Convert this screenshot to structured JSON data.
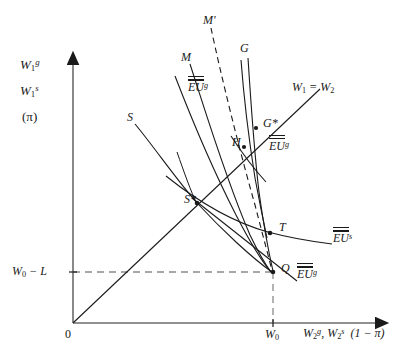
{
  "figure": {
    "type": "economics-indifference-diagram",
    "background": "#ffffff",
    "ink": "#1a1a1a",
    "width": 399,
    "height": 364
  },
  "axes": {
    "origin_label": "0",
    "y_axis_labels": [
      {
        "name": "y-label-wg",
        "text_html": "W<sub>1</sub><sup>g</sup>"
      },
      {
        "name": "y-label-ws",
        "text_html": "W<sub>1</sub><sup>s</sup>"
      },
      {
        "name": "y-label-pi",
        "text_html": "(π)"
      }
    ],
    "x_axis_label_html": "W<sub>2</sub><sup>g</sup>, W<sub>2</sub><sup>s</sup> &nbsp;(1 − π)",
    "x_tick_label_html": "W<sub>0</sub>",
    "y_tick_label_html": "W<sub>0</sub> − L",
    "x_tick_value": "W0",
    "y_tick_value": "W0-L"
  },
  "curve_labels": [
    {
      "name": "curve-label-M-prime",
      "text": "M'",
      "x": 203,
      "y": 14
    },
    {
      "name": "curve-label-M",
      "text": "M",
      "x": 183,
      "y": 51
    },
    {
      "name": "curve-label-G",
      "text": "G",
      "x": 241,
      "y": 42
    },
    {
      "name": "curve-label-S",
      "text": "S",
      "x": 128,
      "y": 112
    },
    {
      "name": "curve-label-W1-eq-W2",
      "text_html": "W<sub>1</sub> = W<sub>2</sub>",
      "x": 292,
      "y": 82
    },
    {
      "name": "curve-label-EUg-bar-upper",
      "text_html": "EU",
      "sup": "g",
      "bars": 1,
      "x": 191,
      "y": 82
    },
    {
      "name": "curve-label-EUg-doublebar",
      "text_html": "EU",
      "sup": "g",
      "bars": 2,
      "x": 271,
      "y": 141
    },
    {
      "name": "curve-label-EUs-bar",
      "text_html": "EU",
      "sup": "s",
      "bars": 1,
      "x": 334,
      "y": 232
    },
    {
      "name": "curve-label-EUg-bar-lower",
      "text_html": "EU",
      "sup": "g",
      "bars": 1,
      "x": 299,
      "y": 268
    }
  ],
  "points": [
    {
      "name": "point-G-star",
      "label": "G*",
      "x": 256,
      "y": 128,
      "label_dx": 7,
      "label_dy": -12
    },
    {
      "name": "point-H",
      "label": "H",
      "x": 243,
      "y": 147,
      "label_dx": -12,
      "label_dy": -12
    },
    {
      "name": "point-S-star",
      "label": "S*",
      "x": 196,
      "y": 203,
      "label_dx": -13,
      "label_dy": -11
    },
    {
      "name": "point-T",
      "label": "T",
      "x": 271,
      "y": 233,
      "label_dx": 8,
      "label_dy": -13
    },
    {
      "name": "point-Q",
      "label": "Q",
      "x": 273,
      "y": 272,
      "label_dx": 7,
      "label_dy": -11
    }
  ],
  "chart_data": {
    "type": "line",
    "title": "",
    "xlabel": "W2g, W2s (1 - pi)",
    "ylabel": "W1g, W1s (pi)",
    "axis_origin_px": [
      73,
      323
    ],
    "x_axis_end_px": [
      385,
      323
    ],
    "y_axis_top_px": [
      73,
      57
    ],
    "w0_px": 273,
    "w0_minus_L_px": 272,
    "series": [
      {
        "name": "45-degree line W1=W2",
        "style": "solid",
        "points": [
          [
            73,
            323
          ],
          [
            318,
            91
          ]
        ]
      },
      {
        "name": "M curve",
        "style": "solid",
        "points": [
          [
            190,
            62
          ],
          [
            230,
            170
          ],
          [
            258,
            250
          ],
          [
            270,
            272
          ]
        ]
      },
      {
        "name": "M-prime curve",
        "style": "dashed",
        "points": [
          [
            210,
            26
          ],
          [
            238,
            120
          ],
          [
            260,
            210
          ],
          [
            272,
            271
          ]
        ]
      },
      {
        "name": "G curve",
        "style": "solid",
        "points": [
          [
            247,
            56
          ],
          [
            253,
            110
          ],
          [
            258,
            170
          ],
          [
            268,
            240
          ],
          [
            273,
            271
          ]
        ]
      },
      {
        "name": "G curve second branch",
        "style": "solid",
        "points": [
          [
            243,
            58
          ],
          [
            250,
            112
          ],
          [
            257,
            165
          ],
          [
            263,
            205
          ],
          [
            266,
            233
          ]
        ]
      },
      {
        "name": "S curve",
        "style": "solid",
        "points": [
          [
            134,
            122
          ],
          [
            196,
            203
          ],
          [
            245,
            252
          ],
          [
            273,
            272
          ]
        ]
      },
      {
        "name": "EU-g upper indifference",
        "style": "solid",
        "points": [
          [
            176,
            75
          ],
          [
            215,
            150
          ],
          [
            248,
            225
          ],
          [
            268,
            268
          ]
        ]
      },
      {
        "name": "EU-g double-bar indifference",
        "style": "solid",
        "points": [
          [
            232,
            140
          ],
          [
            248,
            160
          ],
          [
            262,
            178
          ],
          [
            270,
            186
          ]
        ]
      },
      {
        "name": "EU-s indifference",
        "style": "solid",
        "points": [
          [
            168,
            178
          ],
          [
            215,
            212
          ],
          [
            262,
            231
          ],
          [
            310,
            241
          ],
          [
            330,
            244
          ]
        ]
      },
      {
        "name": "EU-g lower indifference",
        "style": "solid",
        "points": [
          [
            192,
            198
          ],
          [
            230,
            228
          ],
          [
            265,
            258
          ],
          [
            296,
            282
          ]
        ]
      },
      {
        "name": "S-branch curve",
        "style": "solid",
        "points": [
          [
            178,
            155
          ],
          [
            190,
            185
          ],
          [
            196,
            203
          ]
        ]
      }
    ],
    "guides": [
      {
        "name": "horizontal dashed at W0-L",
        "style": "dashed",
        "from": [
          73,
          272
        ],
        "to": [
          273,
          272
        ]
      },
      {
        "name": "vertical dashed at W0",
        "style": "dashed",
        "from": [
          273,
          272
        ],
        "to": [
          273,
          323
        ]
      }
    ],
    "grid": false,
    "legend": "none"
  }
}
